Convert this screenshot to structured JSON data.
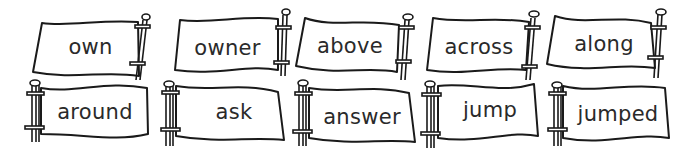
{
  "words": {
    "row1": [
      "own",
      "owner",
      "above",
      "across",
      "along"
    ],
    "row2": [
      "around",
      "ask",
      "answer",
      "jump",
      "jumped"
    ]
  },
  "colors": {
    "outline": "#1a1a1a",
    "text": "#2a2a2a",
    "background": "#ffffff",
    "flag_fill": "#ffffff"
  },
  "layout": {
    "row1_pole_side": "right",
    "row2_pole_side": "left",
    "flag_count": 10
  }
}
